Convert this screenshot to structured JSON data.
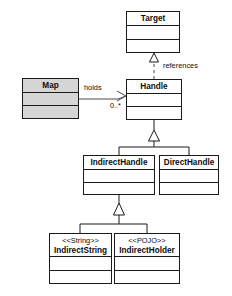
{
  "diagram": {
    "type": "uml-class-diagram",
    "background_color": "#ffffff",
    "line_color": "#1a1a1a",
    "shaded_fill": "#d5d5d5",
    "plain_fill": "#ffffff"
  },
  "classes": {
    "target": {
      "name": "Target",
      "stereotype": "",
      "shaded": false,
      "x": 126,
      "y": 11,
      "w": 54,
      "h": 42,
      "compartments": [
        14,
        14,
        14
      ]
    },
    "map": {
      "name": "Map",
      "stereotype": "",
      "shaded": true,
      "x": 22,
      "y": 78,
      "w": 57,
      "h": 41,
      "compartments": [
        14,
        13,
        14
      ]
    },
    "handle": {
      "name": "Handle",
      "stereotype": "",
      "shaded": false,
      "x": 126,
      "y": 79,
      "w": 56,
      "h": 41,
      "compartments": [
        14,
        13,
        14
      ]
    },
    "indirect_handle": {
      "name": "IndirectHandle",
      "stereotype": "",
      "shaded": false,
      "x": 83,
      "y": 155,
      "w": 72,
      "h": 40,
      "compartments": [
        14,
        13,
        13
      ]
    },
    "direct_handle": {
      "name": "DirectHandle",
      "stereotype": "",
      "shaded": false,
      "x": 159,
      "y": 155,
      "w": 60,
      "h": 40,
      "compartments": [
        14,
        13,
        13
      ]
    },
    "indirect_string": {
      "name": "IndirectString",
      "stereotype": "<<String>>",
      "shaded": false,
      "x": 49,
      "y": 233,
      "w": 63,
      "h": 51,
      "compartments": [
        23,
        14,
        14
      ]
    },
    "indirect_holder": {
      "name": "IndirectHolder",
      "stereotype": "<<POJO>>",
      "shaded": false,
      "x": 114,
      "y": 233,
      "w": 66,
      "h": 51,
      "compartments": [
        23,
        14,
        14
      ]
    }
  },
  "relationships": {
    "references": {
      "label": "references",
      "kind": "realization-dashed",
      "from": "handle",
      "to": "target",
      "label_x": 160,
      "label_y": 67
    },
    "holds": {
      "label": "holds",
      "kind": "association-open-arrow",
      "from": "map",
      "to": "handle",
      "multiplicity": "0..*",
      "label_x": 85,
      "label_y": 88,
      "mult_x": 110,
      "mult_y": 105
    },
    "handle_generalization": {
      "kind": "generalization",
      "parent": "handle",
      "children": [
        "indirect_handle",
        "direct_handle"
      ]
    },
    "indirect_generalization": {
      "kind": "generalization",
      "parent": "indirect_handle",
      "children": [
        "indirect_string",
        "indirect_holder"
      ]
    }
  }
}
